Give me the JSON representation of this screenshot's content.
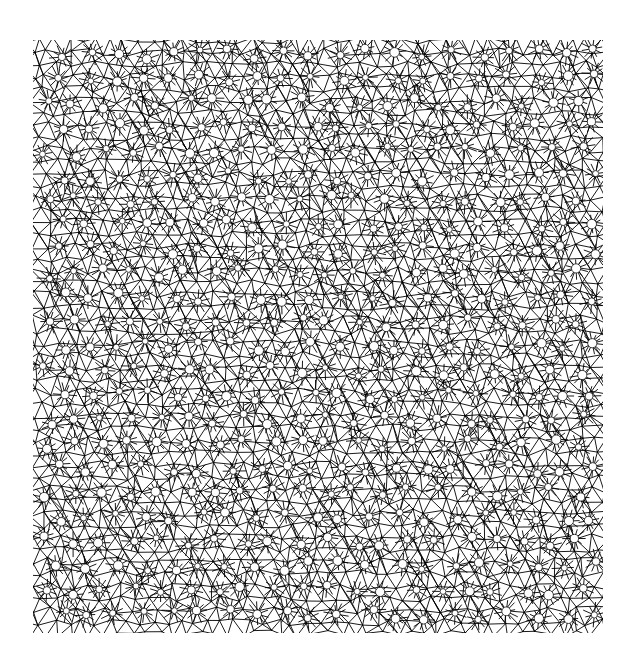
{
  "figure": {
    "description": "Dense triangulated mesh / quasi-periodic tiling with radial wheel hubs",
    "background_color": "#ffffff",
    "line_color": "#000000",
    "frame": {
      "x": 33,
      "y": 40,
      "width": 570,
      "height": 593
    },
    "mesh": {
      "type": "triangulated-quasi-lattice",
      "cell_size": 14,
      "jitter": 0.28,
      "line_width": 0.9,
      "hub_spacing": 28,
      "hub_spokes": 10,
      "hub_radius": 11,
      "hub_hole_radius": 3.2,
      "seed": 7
    }
  }
}
